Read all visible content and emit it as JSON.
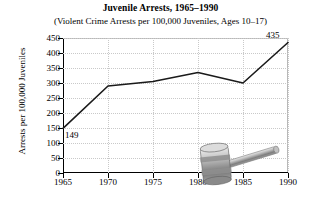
{
  "chart_data": {
    "type": "line",
    "title": "Juvenile Arrests, 1965–1990",
    "subtitle": "(Violent Crime Arrests per 100,000 Juveniles, Ages 10–17)",
    "xlabel": "Year",
    "ylabel": "Arrests per 100,000 Juveniles",
    "x": [
      1965,
      1970,
      1975,
      1980,
      1985,
      1990
    ],
    "categories": [
      "1965",
      "1970",
      "1975",
      "1980",
      "1985",
      "1990"
    ],
    "values": [
      149,
      290,
      305,
      335,
      300,
      435
    ],
    "xlim": [
      1965,
      1990
    ],
    "ylim": [
      0,
      450
    ],
    "yticks": [
      0,
      50,
      100,
      150,
      200,
      250,
      300,
      350,
      400,
      450
    ],
    "ytick_labels": [
      "0",
      "50",
      "100",
      "150",
      "200",
      "250",
      "300",
      "350",
      "400",
      "450"
    ],
    "xticks": [
      1965,
      1970,
      1975,
      1980,
      1985,
      1990
    ],
    "xtick_labels": [
      "1965",
      "1970",
      "1975",
      "1980",
      "1985",
      "1990"
    ],
    "grid": true,
    "legend": "none",
    "line_color": "#1a1a1a",
    "grid_color": "#c9c9c9",
    "point_labels": [
      {
        "text": "149",
        "x": 1965,
        "y": 149
      },
      {
        "text": "435",
        "x": 1990,
        "y": 435
      }
    ],
    "annotations": [
      {
        "name": "gavel-illustration",
        "type": "decorative-image",
        "description": "gray judge's gavel"
      }
    ]
  }
}
